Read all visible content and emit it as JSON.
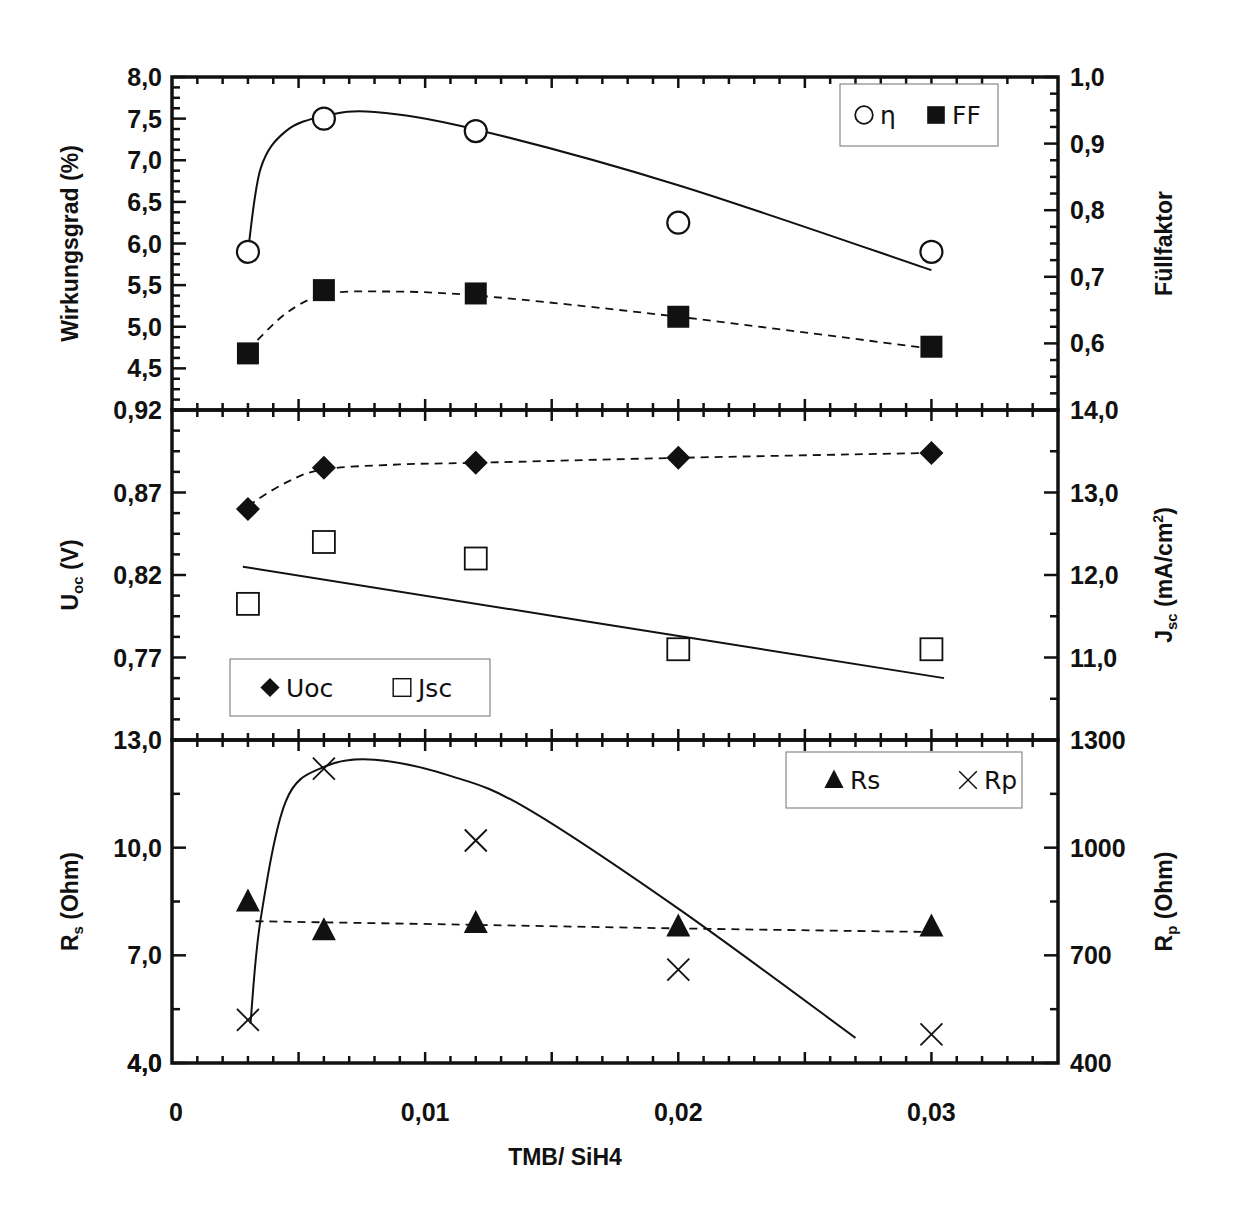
{
  "chart_data": {
    "type": "scatter",
    "layout": "three stacked panels sharing x-axis, each with dual y-axes",
    "xlabel": "TMB/ SiH4",
    "x_ticks": [
      "0",
      "0,01",
      "0,02",
      "0,03"
    ],
    "xlim": [
      0,
      0.035
    ],
    "x": [
      0.003,
      0.006,
      0.012,
      0.02,
      0.03
    ],
    "panels": [
      {
        "id": "top",
        "left_axis": {
          "label": "Wirkungsgrad (%)",
          "ticks": [
            "8,0",
            "7,5",
            "7,0",
            "6,5",
            "6,0",
            "5,5",
            "5,0",
            "4,5"
          ],
          "ylim": [
            4.0,
            8.0
          ]
        },
        "right_axis": {
          "label": "Füllfaktor",
          "ticks": [
            "1,0",
            "0,9",
            "0,8",
            "0,7",
            "0,6"
          ],
          "ylim": [
            0.5,
            1.0
          ]
        },
        "legend": [
          {
            "symbol": "○",
            "label": "η"
          },
          {
            "symbol": "■",
            "label": "FF"
          }
        ],
        "series": [
          {
            "name": "η",
            "axis": "left",
            "marker": "open-circle",
            "fit": "solid",
            "values": [
              5.9,
              7.5,
              7.35,
              6.25,
              5.9
            ]
          },
          {
            "name": "FF",
            "axis": "right",
            "marker": "filled-square",
            "fit": "dashed",
            "values": [
              0.585,
              0.68,
              0.675,
              0.64,
              0.595
            ]
          }
        ]
      },
      {
        "id": "middle",
        "left_axis": {
          "label": "Uoc (V)",
          "label_main": "U",
          "label_sub": "oc",
          "label_rest": " (V)",
          "ticks": [
            "0,92",
            "0,87",
            "0,82",
            "0,77"
          ],
          "ylim": [
            0.72,
            0.92
          ]
        },
        "right_axis": {
          "label": "Jsc (mA/cm²)",
          "label_main": "J",
          "label_sub": "sc",
          "label_rest": " (mA/cm",
          "label_sup": "2",
          "label_end": ")",
          "ticks": [
            "14,0",
            "13,0",
            "12,0",
            "11,0"
          ],
          "ylim": [
            10.0,
            14.0
          ]
        },
        "legend": [
          {
            "symbol": "◆",
            "label": "Uoc"
          },
          {
            "symbol": "□",
            "label": "Jsc"
          }
        ],
        "series": [
          {
            "name": "Uoc",
            "axis": "left",
            "marker": "filled-diamond",
            "fit": "dashed",
            "values": [
              0.86,
              0.885,
              0.888,
              0.891,
              0.894
            ]
          },
          {
            "name": "Jsc",
            "axis": "right",
            "marker": "open-square",
            "fit": "solid-linear",
            "values": [
              11.65,
              12.4,
              12.2,
              11.1,
              11.1
            ]
          }
        ]
      },
      {
        "id": "bottom",
        "left_axis": {
          "label": "Rs (Ohm)",
          "label_main": "R",
          "label_sub": "s",
          "label_rest": " (Ohm)",
          "ticks": [
            "13,0",
            "10,0",
            "7,0",
            "4,0"
          ],
          "ylim": [
            4.0,
            13.0
          ]
        },
        "right_axis": {
          "label": "Rp (Ohm)",
          "label_main": "R",
          "label_sub": "p",
          "label_rest": " (Ohm)",
          "ticks": [
            "1300",
            "1000",
            "700",
            "400"
          ],
          "ylim": [
            400,
            1300
          ]
        },
        "legend": [
          {
            "symbol": "▲",
            "label": "Rs"
          },
          {
            "symbol": "×",
            "label": "Rp"
          }
        ],
        "series": [
          {
            "name": "Rs",
            "axis": "left",
            "marker": "filled-triangle",
            "fit": "dashed",
            "values": [
              8.5,
              7.7,
              7.9,
              7.8,
              7.8
            ]
          },
          {
            "name": "Rp",
            "axis": "right",
            "marker": "cross",
            "fit": "solid",
            "values": [
              520,
              1220,
              1020,
              660,
              480
            ]
          }
        ]
      }
    ],
    "grid": false,
    "colors": {
      "ink": "#111111",
      "legend_border": "#888888",
      "background": "#ffffff"
    }
  }
}
